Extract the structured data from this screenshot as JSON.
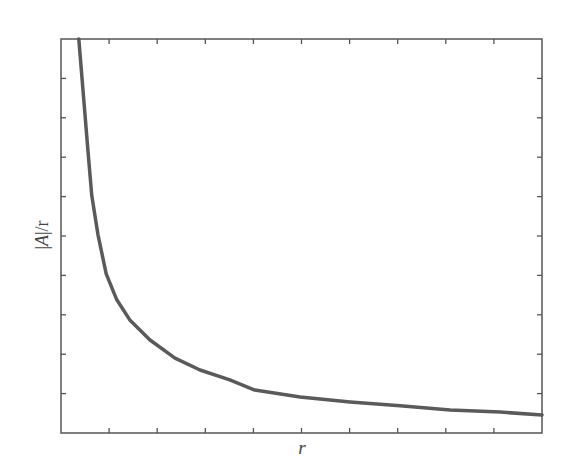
{
  "chart_data": {
    "type": "line",
    "title": "",
    "xlabel": "r",
    "ylabel": "|A|/r",
    "xlim": [
      0,
      10
    ],
    "ylim": [
      0,
      10
    ],
    "x_tick_labels": [],
    "y_tick_labels": [],
    "x_ticks": [
      1,
      2,
      3,
      4,
      5,
      6,
      7,
      8,
      9
    ],
    "y_ticks": [
      1,
      2,
      3,
      4,
      5,
      6,
      7,
      8,
      9
    ],
    "grid": false,
    "legend": null,
    "series": [
      {
        "name": "|A|/r",
        "color": "#5a5a5a",
        "x": [
          0.37,
          0.56,
          0.64,
          0.77,
          0.94,
          1.16,
          1.43,
          1.85,
          2.37,
          2.89,
          3.51,
          4.03,
          4.97,
          6.01,
          7.05,
          8.09,
          9.13,
          10.0
        ],
        "y": [
          10.0,
          7.18,
          6.02,
          5.03,
          4.04,
          3.38,
          2.87,
          2.36,
          1.9,
          1.6,
          1.35,
          1.09,
          0.91,
          0.79,
          0.69,
          0.58,
          0.53,
          0.46
        ]
      }
    ]
  },
  "axis": {
    "frame_color": "#555555"
  },
  "labels": {
    "x": "r",
    "y_bar_left": "|",
    "y_var": "A",
    "y_rest": "|/r"
  }
}
